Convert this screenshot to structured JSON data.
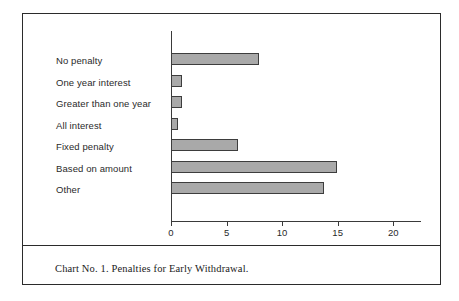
{
  "caption": "Chart No. 1. Penalties for Early Withdrawal.",
  "colors": {
    "frame": "#2b2b2b",
    "bar_fill": "#a9a9a9",
    "bar_edge": "#3d3d3d",
    "axis": "#3a3a3a",
    "text": "#2a2a2a",
    "background": "#ffffff"
  },
  "chart_data": {
    "type": "bar",
    "orientation": "horizontal",
    "title": "",
    "subtitle": "",
    "xlabel": "",
    "ylabel": "",
    "categories": [
      "No penalty",
      "One year interest",
      "Greater than one year",
      "All interest",
      "Fixed penalty",
      "Based on amount",
      "Other"
    ],
    "values": [
      7.9,
      1.0,
      1.0,
      0.6,
      6.0,
      14.9,
      13.8
    ],
    "xlim": [
      0,
      22.5
    ],
    "xticks": [
      0,
      5,
      10,
      15,
      20
    ],
    "xtick_labels": [
      "0",
      "5",
      "10",
      "15",
      "20"
    ],
    "grid": false,
    "legend": null
  }
}
